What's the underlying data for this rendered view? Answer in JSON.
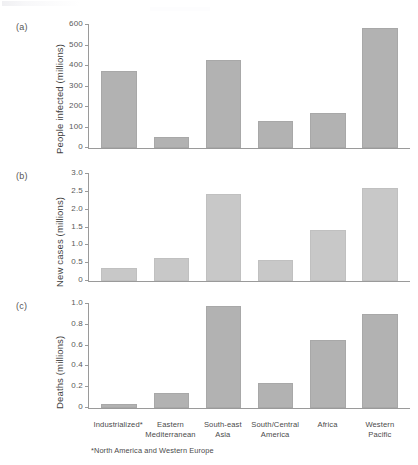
{
  "figure": {
    "categories": [
      "Industrialized*",
      "Eastern\nMediterranean",
      "South-east\nAsia",
      "South/Central\nAmerica",
      "Africa",
      "Western\nPacific"
    ],
    "footnote": "*North America and Western Europe",
    "bar_color": "#b2b2b2",
    "bar_color_light": "#c8c8c8",
    "axis_color": "#9a9a9a"
  },
  "panels": {
    "a": {
      "letter": "(a)",
      "ylabel": "People infected (millions)"
    },
    "b": {
      "letter": "(b)",
      "ylabel": "New cases (millions)"
    },
    "c": {
      "letter": "(c)",
      "ylabel": "Deaths (millions)"
    }
  },
  "chart_data": [
    {
      "type": "bar",
      "panel": "a",
      "title": "",
      "xlabel": "",
      "ylabel": "People infected (millions)",
      "categories": [
        "Industrialized*",
        "Eastern Mediterranean",
        "South-east Asia",
        "South/Central America",
        "Africa",
        "Western Pacific"
      ],
      "values": [
        375,
        55,
        430,
        130,
        172,
        585
      ],
      "ylim": [
        0,
        600
      ],
      "yticks": [
        0,
        100,
        200,
        300,
        400,
        500,
        600
      ],
      "ytick_labels": [
        "0",
        "100",
        "200",
        "300",
        "400",
        "500",
        "600"
      ],
      "grid": false,
      "legend": "none"
    },
    {
      "type": "bar",
      "panel": "b",
      "title": "",
      "xlabel": "",
      "ylabel": "New cases (millions)",
      "categories": [
        "Industrialized*",
        "Eastern Mediterranean",
        "South-east Asia",
        "South/Central America",
        "Africa",
        "Western Pacific"
      ],
      "values": [
        0.36,
        0.64,
        2.45,
        0.6,
        1.44,
        2.62
      ],
      "ylim": [
        0,
        3.0
      ],
      "yticks": [
        0,
        0.5,
        1.0,
        1.5,
        2.0,
        2.5,
        3.0
      ],
      "ytick_labels": [
        "0",
        "0.5",
        "1.0",
        "1.5",
        "2.0",
        "2.5",
        "3.0"
      ],
      "grid": false,
      "legend": "none"
    },
    {
      "type": "bar",
      "panel": "c",
      "title": "",
      "xlabel": "",
      "ylabel": "Deaths (millions)",
      "categories": [
        "Industrialized*",
        "Eastern Mediterranean",
        "South-east Asia",
        "South/Central America",
        "Africa",
        "Western Pacific"
      ],
      "values": [
        0.035,
        0.14,
        0.98,
        0.24,
        0.65,
        0.9
      ],
      "ylim": [
        0,
        1.0
      ],
      "yticks": [
        0,
        0.2,
        0.4,
        0.6,
        0.8,
        1.0
      ],
      "ytick_labels": [
        "0",
        "0.2",
        "0.4",
        "0.6",
        "0.8",
        "1.0"
      ],
      "grid": false,
      "legend": "none"
    }
  ]
}
